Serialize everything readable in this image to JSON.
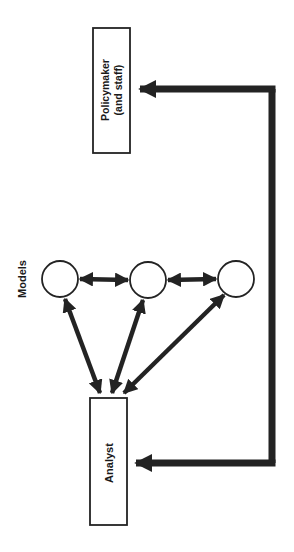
{
  "diagram": {
    "nodes": {
      "policymaker": {
        "line1": "Policymaker",
        "line2": "(and staff)"
      },
      "analyst": {
        "label": "Analyst"
      },
      "models": {
        "label": "Models",
        "count": 3
      }
    },
    "edges": [
      {
        "from": "analyst",
        "to": "policymaker",
        "type": "feedback-loop"
      },
      {
        "from": "policymaker",
        "to": "analyst",
        "type": "feedback-loop"
      },
      {
        "from": "analyst",
        "to": "model-1",
        "type": "bidirectional"
      },
      {
        "from": "analyst",
        "to": "model-2",
        "type": "bidirectional"
      },
      {
        "from": "analyst",
        "to": "model-3",
        "type": "bidirectional"
      },
      {
        "from": "model-1",
        "to": "model-2",
        "type": "bidirectional"
      },
      {
        "from": "model-2",
        "to": "model-3",
        "type": "bidirectional"
      }
    ],
    "colors": {
      "ink": "#232323",
      "background": "#ffffff"
    }
  }
}
